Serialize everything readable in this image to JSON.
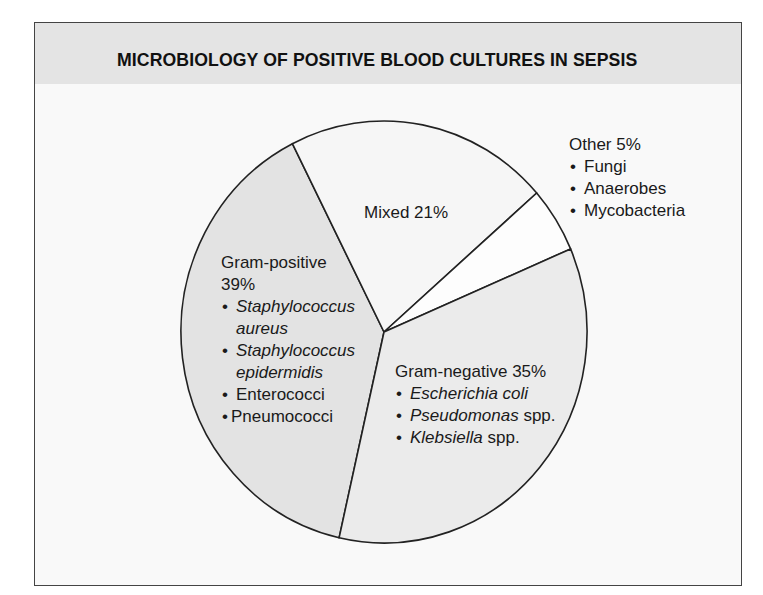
{
  "title": "MICROBIOLOGY OF POSITIVE BLOOD CULTURES IN SEPSIS",
  "colors": {
    "header_bg": "#e4e4e4",
    "panel_bg": "#f9f9f9",
    "gram_positive": "#e3e3e3",
    "mixed": "#f6f6f6",
    "other": "#fdfdfd",
    "gram_negative": "#ebebeb",
    "outline": "#222222"
  },
  "labels": {
    "gram_positive": {
      "name": "Gram-positive",
      "pct": "39%",
      "items": [
        {
          "italic": "Staphylococcus",
          "rest": ""
        },
        {
          "italic": "aureus",
          "rest": "",
          "continuation": true
        },
        {
          "italic": "Staphylococcus",
          "rest": ""
        },
        {
          "italic": "epidermidis",
          "rest": "",
          "continuation": true
        },
        {
          "italic": "",
          "rest": "Enterococci"
        },
        {
          "italic": "",
          "rest": "Pneumococci"
        }
      ]
    },
    "mixed": {
      "name": "Mixed 21%"
    },
    "other": {
      "name": "Other 5%",
      "items": [
        "Fungi",
        "Anaerobes",
        "Mycobacteria"
      ]
    },
    "gram_negative": {
      "name": "Gram-negative 35%",
      "items": [
        {
          "italic": "Escherichia coli",
          "rest": ""
        },
        {
          "italic": "Pseudomonas",
          "rest": " spp."
        },
        {
          "italic": "Klebsiella",
          "rest": " spp."
        }
      ]
    }
  },
  "chart_data": {
    "type": "pie",
    "title": "MICROBIOLOGY OF POSITIVE BLOOD CULTURES IN SEPSIS",
    "categories": [
      "Gram-positive",
      "Mixed",
      "Other",
      "Gram-negative"
    ],
    "values": [
      39,
      21,
      5,
      35
    ],
    "units": "%",
    "annotations": {
      "Gram-positive": [
        "Staphylococcus aureus",
        "Staphylococcus epidermidis",
        "Enterococci",
        "Pneumococci"
      ],
      "Other": [
        "Fungi",
        "Anaerobes",
        "Mycobacteria"
      ],
      "Gram-negative": [
        "Escherichia coli",
        "Pseudomonas spp.",
        "Klebsiella spp."
      ]
    },
    "legend": "none (direct labels)"
  }
}
